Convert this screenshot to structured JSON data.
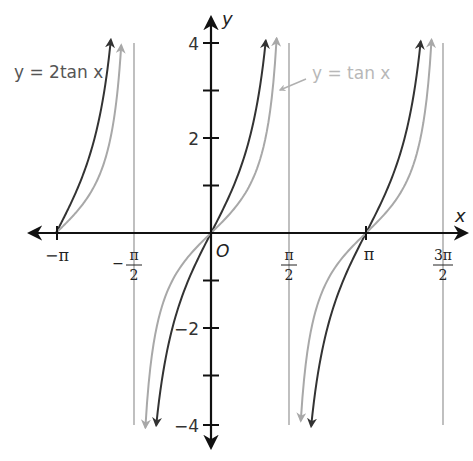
{
  "chart_data": {
    "type": "line",
    "title": "",
    "xlabel": "x",
    "ylabel": "y",
    "origin_label": "O",
    "xlim": [
      -3.3,
      5.0
    ],
    "ylim": [
      -4.3,
      4.3
    ],
    "grid": false,
    "x_ticks": [
      {
        "value": -3.14159,
        "label_num": "−π",
        "label_den": ""
      },
      {
        "value": -1.5708,
        "label_num": "π",
        "label_den": "2",
        "sign": "−"
      },
      {
        "value": 1.5708,
        "label_num": "π",
        "label_den": "2",
        "sign": ""
      },
      {
        "value": 3.14159,
        "label_num": "π",
        "label_den": ""
      },
      {
        "value": 4.71239,
        "label_num": "3π",
        "label_den": "2",
        "sign": ""
      }
    ],
    "y_ticks": [
      {
        "value": 4,
        "label": "4"
      },
      {
        "value": 3,
        "label": ""
      },
      {
        "value": 2,
        "label": "2"
      },
      {
        "value": 1,
        "label": ""
      },
      {
        "value": -1,
        "label": ""
      },
      {
        "value": -2,
        "label": "−2"
      },
      {
        "value": -3,
        "label": ""
      },
      {
        "value": -4,
        "label": "−4"
      }
    ],
    "asymptotes": [
      -1.5708,
      1.5708,
      4.71239
    ],
    "series": [
      {
        "name": "y = 2tan x",
        "function": "2*tan(x)",
        "color": "#333333",
        "domain_branches": [
          [
            -3.14159,
            -2.03
          ],
          [
            -1.11,
            1.11
          ],
          [
            2.03,
            4.25
          ]
        ]
      },
      {
        "name": "y = tan x",
        "function": "tan(x)",
        "color": "#a8a8a8",
        "domain_branches": [
          [
            -3.14159,
            -1.82
          ],
          [
            -1.33,
            1.33
          ],
          [
            1.82,
            4.47
          ]
        ]
      }
    ],
    "legend": [
      {
        "text": "y = 2tan x",
        "position": "top-left"
      },
      {
        "text": "y = tan x",
        "position": "top-right, with arrow pointer"
      }
    ]
  },
  "labels": {
    "y_axis": "y",
    "x_axis": "x",
    "origin": "O",
    "series_2tan": "y = 2tan x",
    "series_tan": "y = tan x",
    "y4": "4",
    "y2": "2",
    "ym2": "−2",
    "ym4": "−4",
    "xneg_pi": "−π",
    "xneg_half_pi_num": "π",
    "xneg_half_pi_den": "2",
    "xneg_sign": "−",
    "xhalf_pi_num": "π",
    "xhalf_pi_den": "2",
    "xpi": "π",
    "x3half_pi_num": "3π",
    "x3half_pi_den": "2"
  },
  "colors": {
    "axis": "#111111",
    "dark_curve": "#333333",
    "light_curve": "#a8a8a8",
    "asymptote": "#b0b0b0",
    "label_dark": "#444444",
    "label_light": "#b8b8b8"
  }
}
